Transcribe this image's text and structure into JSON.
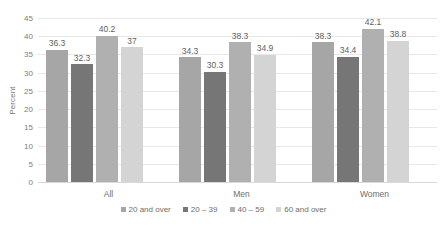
{
  "chart_data": {
    "type": "bar",
    "title": "",
    "subtitle": "",
    "xlabel": "",
    "ylabel": "Percent",
    "ylim": [
      0,
      45
    ],
    "ytick_step": 5,
    "yticks": [
      "45",
      "40",
      "35",
      "30",
      "25",
      "20",
      "15",
      "10",
      "5",
      "0"
    ],
    "grid": true,
    "legend_position": "bottom",
    "categories": [
      "All",
      "Men",
      "Women"
    ],
    "series": [
      {
        "name": "20 and over",
        "color": "#a6a6a6",
        "values": [
          36.3,
          34.3,
          38.3
        ],
        "labels": [
          "36.3",
          "34.3",
          "38.3"
        ]
      },
      {
        "name": "20 – 39",
        "color": "#767676",
        "values": [
          32.3,
          30.3,
          34.4
        ],
        "labels": [
          "32.3",
          "30.3",
          "34.4"
        ]
      },
      {
        "name": "40 – 59",
        "color": "#b0b0b0",
        "values": [
          40.2,
          38.3,
          42.1
        ],
        "labels": [
          "40.2",
          "38.3",
          "42.1"
        ]
      },
      {
        "name": "60 and over",
        "color": "#d4d4d4",
        "values": [
          37.0,
          34.9,
          38.8
        ],
        "labels": [
          "37",
          "34.9",
          "38.8"
        ]
      }
    ]
  },
  "colors": {
    "background": "#ffffff",
    "gridline": "#e8e8e8",
    "axis": "#d9d9d9",
    "tick_text": "#7d7d7d",
    "label_text": "#5f5f5f"
  }
}
